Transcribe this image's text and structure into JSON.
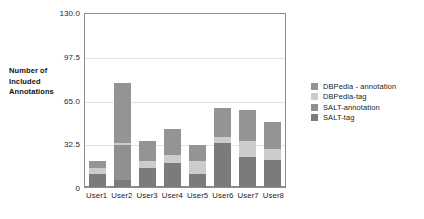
{
  "chart_data": {
    "type": "bar",
    "stacked": true,
    "title": "",
    "xlabel": "",
    "ylabel": "Number of Included Annotations",
    "ylim": [
      0,
      130
    ],
    "yticks": [
      "0",
      "32.5",
      "65.0",
      "97.5",
      "130.0"
    ],
    "ytick_values": [
      0,
      32.5,
      65.0,
      97.5,
      130.0
    ],
    "grid": true,
    "legend_position": "right",
    "categories": [
      "User1",
      "User2",
      "User3",
      "User4",
      "User5",
      "User6",
      "User7",
      "User8"
    ],
    "series": [
      {
        "name": "SALT-tag",
        "color": "#7b7b7b",
        "values": [
          10,
          5,
          14,
          18,
          10,
          33,
          22,
          20
        ]
      },
      {
        "name": "SALT-annotation",
        "color": "#8f8f8f",
        "values": [
          0,
          26,
          0,
          0,
          0,
          0,
          0,
          0
        ]
      },
      {
        "name": "DBPedia-tag",
        "color": "#cccccc",
        "values": [
          4,
          1.5,
          5,
          6,
          9,
          4,
          12,
          8
        ]
      },
      {
        "name": "DBPedia - annotation",
        "color": "#949494",
        "values": [
          5,
          45,
          15,
          19,
          12,
          22,
          23,
          20
        ]
      }
    ],
    "totals": [
      19,
      77.5,
      34,
      43,
      31,
      59,
      57,
      48
    ]
  },
  "axis_title_lines": [
    "Number of",
    "Included",
    "Annotations"
  ],
  "legend": {
    "items": [
      {
        "label": "DBPedia - annotation",
        "color": "#949494"
      },
      {
        "label": "DBPedia-tag",
        "color": "#cccccc"
      },
      {
        "label": "SALT-annotation",
        "color": "#8f8f8f"
      },
      {
        "label": "SALT-tag",
        "color": "#7b7b7b"
      }
    ]
  },
  "colors": {
    "axis": "#8d8d8d",
    "grid": "#e2e2e2",
    "background": "#ffffff",
    "text": "#1c1c1c"
  }
}
